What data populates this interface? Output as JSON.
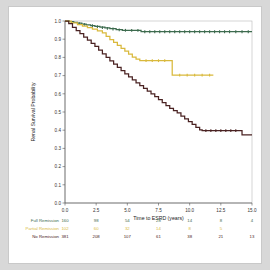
{
  "figure": {
    "background": "#ffffff",
    "page_background": "#d8d8d8"
  },
  "chart_data": {
    "type": "line",
    "title": "",
    "xlabel": "Time to ESRD (years)",
    "ylabel": "Renal Survival Probability",
    "xlim": [
      0.0,
      15.0
    ],
    "ylim": [
      0.0,
      1.0
    ],
    "xticks": [
      0.0,
      2.5,
      5.0,
      7.5,
      10.0,
      12.5,
      15.0
    ],
    "xticklabels": [
      "0.0",
      "2.5",
      "5.0",
      "7.5",
      "10.0",
      "12.5",
      "15.0"
    ],
    "yticks": [
      0.0,
      0.1,
      0.2,
      0.3,
      0.4,
      0.5,
      0.6,
      0.7,
      0.8,
      0.9,
      1.0
    ],
    "yticklabels": [
      "0.0",
      "0.1",
      "0.2",
      "0.3",
      "0.4",
      "0.5",
      "0.6",
      "0.7",
      "0.8",
      "0.9",
      "1.0"
    ],
    "grid": false,
    "legend_position": "none",
    "step_style": "post",
    "series": [
      {
        "name": "Full Remission",
        "color": "#3d6b4e",
        "x": [
          0.0,
          0.35,
          0.7,
          1.0,
          1.35,
          1.7,
          2.05,
          2.4,
          2.8,
          3.2,
          3.6,
          4.1,
          4.6,
          5.1,
          5.6,
          6.1,
          15.0
        ],
        "y": [
          1.0,
          0.996,
          0.992,
          0.988,
          0.983,
          0.979,
          0.975,
          0.971,
          0.966,
          0.962,
          0.958,
          0.953,
          0.949,
          0.949,
          0.949,
          0.941,
          0.941
        ],
        "censor_x": [
          1.15,
          1.55,
          2.2,
          2.6,
          3.0,
          3.4,
          3.85,
          4.35,
          4.85,
          5.35,
          5.85,
          6.4,
          6.8,
          7.2,
          7.6,
          8.0,
          8.4,
          8.8,
          9.2,
          9.6,
          10.0,
          10.4,
          10.8,
          11.2,
          11.6,
          12.0,
          12.4,
          12.8,
          13.2,
          13.7,
          14.2,
          14.7
        ],
        "censor_y": [
          0.986,
          0.981,
          0.974,
          0.969,
          0.964,
          0.96,
          0.956,
          0.951,
          0.949,
          0.949,
          0.949,
          0.941,
          0.941,
          0.941,
          0.941,
          0.941,
          0.941,
          0.941,
          0.941,
          0.941,
          0.941,
          0.941,
          0.941,
          0.941,
          0.941,
          0.941,
          0.941,
          0.941,
          0.941,
          0.941,
          0.941,
          0.941
        ]
      },
      {
        "name": "Partial Remission",
        "color": "#d9b93c",
        "x": [
          0.0,
          0.5,
          1.0,
          1.4,
          1.8,
          2.2,
          2.6,
          3.0,
          3.3,
          3.6,
          3.9,
          4.2,
          4.5,
          4.8,
          5.1,
          5.4,
          5.7,
          6.0,
          8.6,
          11.9
        ],
        "y": [
          1.0,
          0.99,
          0.98,
          0.972,
          0.963,
          0.955,
          0.946,
          0.935,
          0.915,
          0.898,
          0.882,
          0.866,
          0.85,
          0.834,
          0.818,
          0.802,
          0.79,
          0.782,
          0.703,
          0.703
        ],
        "censor_x": [
          6.5,
          7.0,
          7.5,
          8.0,
          9.2,
          9.8,
          10.4,
          11.0,
          11.6
        ],
        "censor_y": [
          0.782,
          0.782,
          0.782,
          0.782,
          0.703,
          0.703,
          0.703,
          0.703,
          0.703
        ]
      },
      {
        "name": "No Remission",
        "color": "#4a2222",
        "x": [
          0.0,
          0.3,
          0.6,
          0.9,
          1.2,
          1.5,
          1.8,
          2.1,
          2.4,
          2.7,
          3.0,
          3.3,
          3.6,
          3.9,
          4.2,
          4.5,
          4.8,
          5.1,
          5.4,
          5.7,
          6.0,
          6.3,
          6.6,
          6.9,
          7.2,
          7.5,
          7.8,
          8.1,
          8.4,
          8.7,
          9.0,
          9.3,
          9.6,
          9.9,
          10.2,
          10.5,
          10.8,
          11.0,
          13.9,
          14.2,
          15.0
        ],
        "y": [
          1.0,
          0.985,
          0.965,
          0.947,
          0.93,
          0.912,
          0.895,
          0.877,
          0.86,
          0.84,
          0.82,
          0.8,
          0.781,
          0.763,
          0.745,
          0.727,
          0.71,
          0.693,
          0.676,
          0.66,
          0.645,
          0.63,
          0.615,
          0.6,
          0.585,
          0.568,
          0.552,
          0.535,
          0.52,
          0.508,
          0.495,
          0.478,
          0.462,
          0.447,
          0.432,
          0.415,
          0.402,
          0.398,
          0.398,
          0.375,
          0.375
        ],
        "censor_x": [
          11.3,
          11.7,
          12.1,
          12.5,
          12.9,
          13.3,
          13.7
        ],
        "censor_y": [
          0.398,
          0.398,
          0.398,
          0.398,
          0.398,
          0.398,
          0.398
        ]
      }
    ]
  },
  "risk_table": {
    "time_points": [
      "0.0",
      "2.5",
      "5.0",
      "7.5",
      "10.0",
      "12.5",
      "15.0"
    ],
    "rows": [
      {
        "label": "Full Remission",
        "color": "#3d6b4e",
        "counts": [
          "160",
          "98",
          "54",
          "28",
          "14",
          "8",
          "4"
        ]
      },
      {
        "label": "Partial Remission",
        "color": "#d9b93c",
        "counts": [
          "102",
          "60",
          "32",
          "14",
          "8",
          "5",
          ""
        ]
      },
      {
        "label": "No Remission",
        "color": "#4a2222",
        "counts": [
          "381",
          "208",
          "107",
          "61",
          "38",
          "21",
          "13"
        ]
      }
    ]
  }
}
